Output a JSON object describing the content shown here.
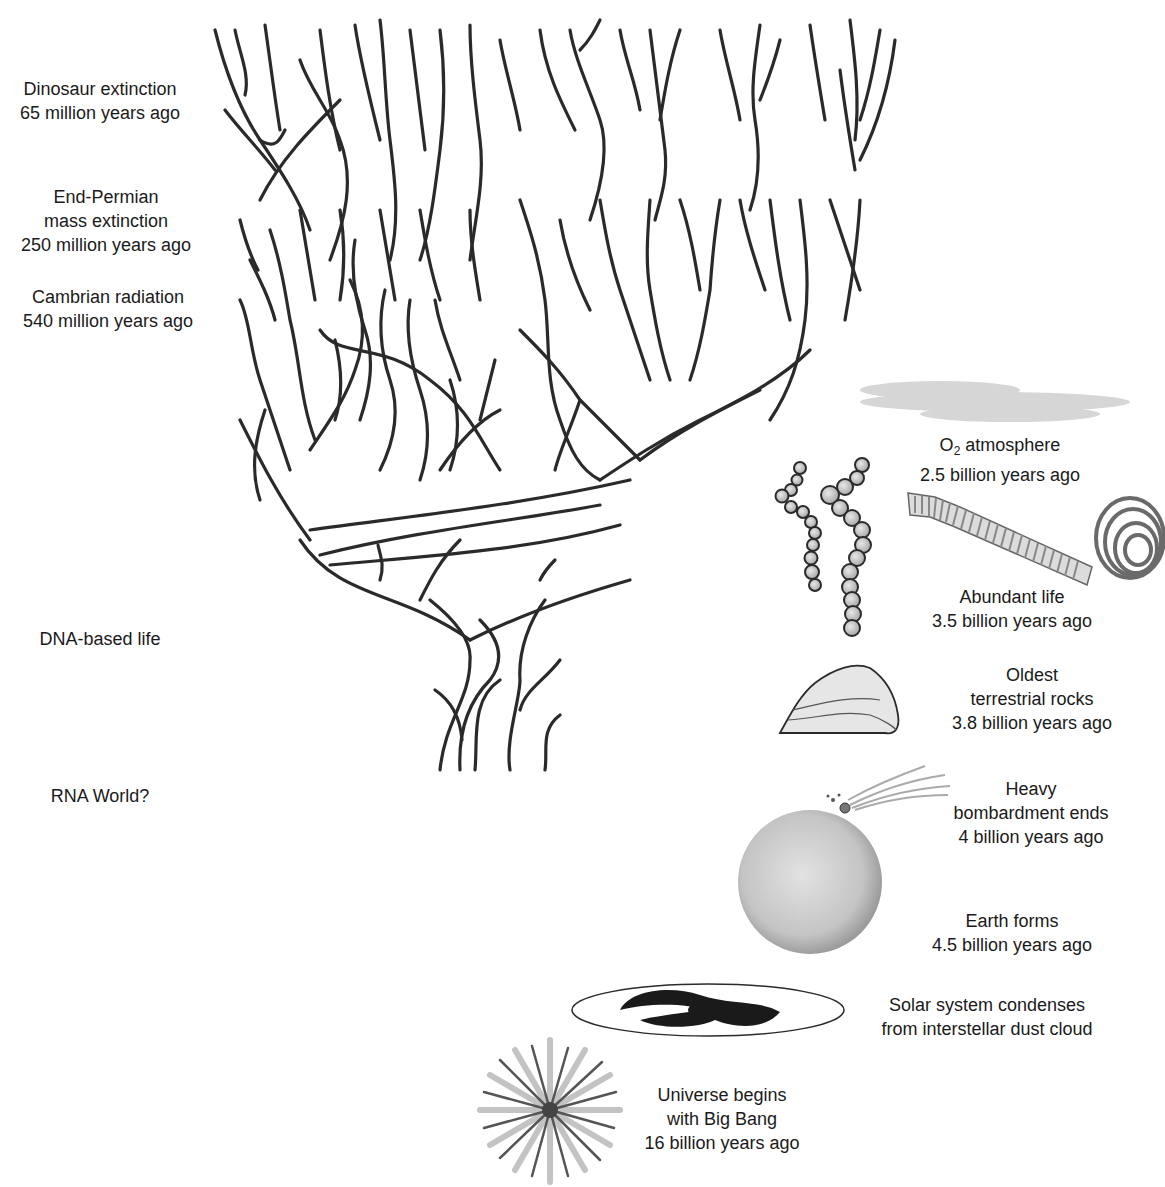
{
  "left_labels": [
    {
      "id": "dinosaur",
      "lines": [
        "Dinosaur extinction",
        "65 million years ago"
      ],
      "x": 100,
      "y": 77
    },
    {
      "id": "permian",
      "lines": [
        "End-Permian",
        "mass extinction",
        "250 million years ago"
      ],
      "x": 106,
      "y": 185
    },
    {
      "id": "cambrian",
      "lines": [
        "Cambrian radiation",
        "540 million years ago"
      ],
      "x": 108,
      "y": 285
    },
    {
      "id": "dna",
      "lines": [
        "DNA-based life"
      ],
      "x": 100,
      "y": 627
    },
    {
      "id": "rna",
      "lines": [
        "RNA World?"
      ],
      "x": 100,
      "y": 784
    }
  ],
  "right_labels": [
    {
      "id": "oxygen",
      "formula_prefix": "O",
      "formula_sub": "2",
      "formula_rest": " atmosphere",
      "lines": [
        "2.5 billion years ago"
      ],
      "x": 1000,
      "y": 433
    },
    {
      "id": "abundant",
      "lines": [
        "Abundant life",
        "3.5 billion years ago"
      ],
      "x": 1012,
      "y": 585
    },
    {
      "id": "rocks",
      "lines": [
        "Oldest",
        "terrestrial rocks",
        "3.8 billion years ago"
      ],
      "x": 1032,
      "y": 663
    },
    {
      "id": "bombardment",
      "lines": [
        "Heavy",
        "bombardment ends",
        "4 billion years ago"
      ],
      "x": 1031,
      "y": 777
    },
    {
      "id": "earth",
      "lines": [
        "Earth forms",
        "4.5 billion years ago"
      ],
      "x": 1012,
      "y": 909
    },
    {
      "id": "solar",
      "lines": [
        "Solar system condenses",
        "from interstellar dust cloud"
      ],
      "x": 987,
      "y": 993
    },
    {
      "id": "bigbang",
      "lines": [
        "Universe begins",
        "with Big Bang",
        "16 billion years ago"
      ],
      "x": 722,
      "y": 1083
    }
  ],
  "icons": [
    "tree-of-life-icon",
    "oxygen-cloud-icon",
    "bacteria-chain-icon",
    "filament-icon",
    "spiral-icon",
    "rock-icon",
    "meteor-icon",
    "earth-icon",
    "galaxy-icon",
    "big-bang-icon"
  ],
  "colors": {
    "ink": "#2a2a2a",
    "grey": "#8a8a8a",
    "light": "#d4d4d4"
  }
}
